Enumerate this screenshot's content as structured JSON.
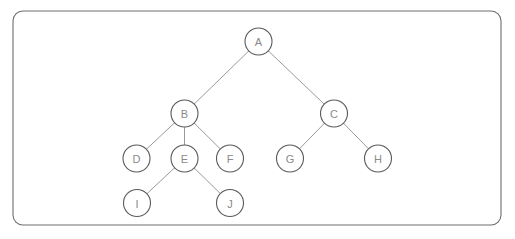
{
  "diagram": {
    "type": "tree-diagram",
    "canvas": {
      "width": 515,
      "height": 239,
      "background": "#ffffff"
    },
    "frame": {
      "name": "diagram-border",
      "x": 13,
      "y": 11,
      "width": 488,
      "height": 214,
      "corner_radius": 10,
      "stroke": "#6e6e6e",
      "stroke_width": 1.1,
      "fill": "none"
    },
    "style": {
      "node_radius": 13.5,
      "node_fill": "#ffffff",
      "node_stroke": "#5a5a5a",
      "node_stroke_width": 1.1,
      "label_color": "#8a8a8a",
      "label_font_size": 11,
      "edge_stroke": "#9a9a9a",
      "edge_stroke_width": 1
    },
    "nodes": [
      {
        "id": "A",
        "label": "A",
        "cx": 258.5,
        "cy": 41.5,
        "depth": 0
      },
      {
        "id": "B",
        "label": "B",
        "cx": 184.5,
        "cy": 113.5,
        "depth": 1
      },
      {
        "id": "C",
        "label": "C",
        "cx": 334.0,
        "cy": 113.5,
        "depth": 1
      },
      {
        "id": "D",
        "label": "D",
        "cx": 136.5,
        "cy": 158.5,
        "depth": 2
      },
      {
        "id": "E",
        "label": "E",
        "cx": 184.5,
        "cy": 158.5,
        "depth": 2
      },
      {
        "id": "F",
        "label": "F",
        "cx": 230.0,
        "cy": 158.5,
        "depth": 2
      },
      {
        "id": "G",
        "label": "G",
        "cx": 290.0,
        "cy": 158.5,
        "depth": 2
      },
      {
        "id": "H",
        "label": "H",
        "cx": 378.0,
        "cy": 158.5,
        "depth": 2
      },
      {
        "id": "I",
        "label": "I",
        "cx": 137.0,
        "cy": 203.0,
        "depth": 3
      },
      {
        "id": "J",
        "label": "J",
        "cx": 230.0,
        "cy": 203.0,
        "depth": 3
      }
    ],
    "edges": [
      {
        "from": "A",
        "to": "B"
      },
      {
        "from": "A",
        "to": "C"
      },
      {
        "from": "B",
        "to": "D"
      },
      {
        "from": "B",
        "to": "E"
      },
      {
        "from": "B",
        "to": "F"
      },
      {
        "from": "C",
        "to": "G"
      },
      {
        "from": "C",
        "to": "H"
      },
      {
        "from": "E",
        "to": "I"
      },
      {
        "from": "E",
        "to": "J"
      }
    ]
  }
}
